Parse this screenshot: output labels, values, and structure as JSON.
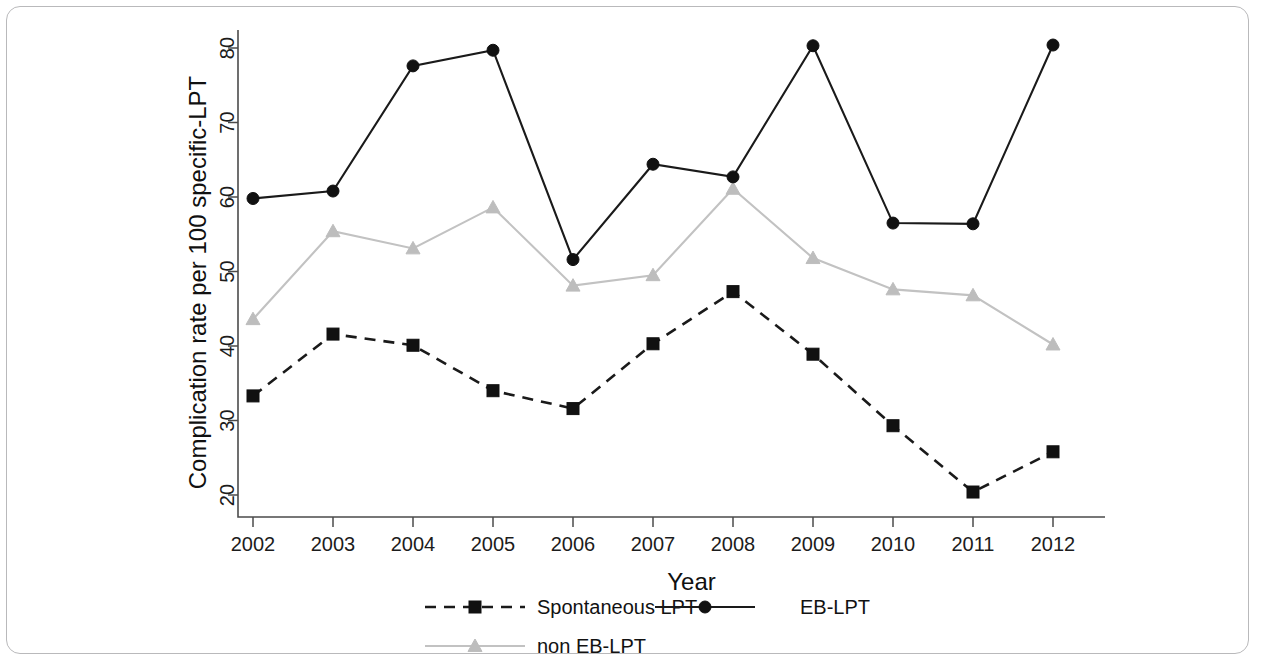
{
  "figure": {
    "border_color": "#b9b9bb",
    "background": "#ffffff"
  },
  "chart_data": {
    "type": "line",
    "title": "",
    "xlabel": "Year",
    "ylabel": "Complication rate per 100 specific-LPT",
    "categories": [
      "2002",
      "2003",
      "2004",
      "2005",
      "2006",
      "2007",
      "2008",
      "2009",
      "2010",
      "2011",
      "2012"
    ],
    "x": [
      2002,
      2003,
      2004,
      2005,
      2006,
      2007,
      2008,
      2009,
      2010,
      2011,
      2012
    ],
    "xlim": [
      2002,
      2012
    ],
    "ylim": [
      18,
      82
    ],
    "yticks": [
      20,
      30,
      40,
      50,
      60,
      70,
      80
    ],
    "ytick_labels": [
      "20",
      "30",
      "40",
      "50",
      "60",
      "70",
      "80"
    ],
    "grid": false,
    "legend_position": "bottom",
    "series": [
      {
        "name": "Spontaneous LPT",
        "color": "#111111",
        "line_style": "dashed",
        "marker": "square",
        "values": [
          33.3,
          41.6,
          40.1,
          34.0,
          31.6,
          40.3,
          47.3,
          38.9,
          29.3,
          20.4,
          25.8
        ]
      },
      {
        "name": "EB-LPT",
        "color": "#111111",
        "line_style": "solid",
        "marker": "circle",
        "values": [
          59.8,
          60.8,
          77.6,
          79.7,
          51.6,
          64.4,
          62.7,
          80.3,
          56.5,
          56.4,
          80.4
        ]
      },
      {
        "name": "non EB-LPT",
        "color": "#bdbdbd",
        "line_style": "solid",
        "marker": "triangle",
        "values": [
          43.6,
          55.4,
          53.1,
          58.6,
          48.1,
          49.5,
          61.1,
          51.8,
          47.6,
          46.8,
          40.2
        ]
      }
    ]
  },
  "legend": {
    "entries": [
      {
        "label": "Spontaneous LPT"
      },
      {
        "label": "EB-LPT"
      },
      {
        "label": "non EB-LPT"
      }
    ]
  }
}
